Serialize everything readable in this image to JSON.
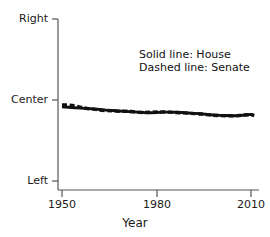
{
  "figure": {
    "background_color": "#ffffff",
    "ink_color": "#111111",
    "axis_color": "#555555"
  },
  "axes": {
    "xlabel": "Year",
    "ylabel": "",
    "x_ticks": [
      "1950",
      "1980",
      "2010"
    ],
    "y_ticks": [
      "Right",
      "Center",
      "Left"
    ]
  },
  "legend": {
    "solid": "Solid line: House",
    "dashed": "Dashed line: Senate"
  },
  "chart_data": {
    "type": "line",
    "title": "",
    "subtitle": "",
    "xlabel": "Year",
    "ylabel": "",
    "xlim": [
      1950,
      2012
    ],
    "ylim": [
      -1,
      1
    ],
    "xticks": [
      1950,
      1980,
      2010
    ],
    "xticklabels": [
      "1950",
      "1980",
      "2010"
    ],
    "yticks": [
      1,
      0,
      -1
    ],
    "yticklabels": [
      "Right",
      "Center",
      "Left"
    ],
    "grid": false,
    "legend_position": "upper-right-inside",
    "annotations": [
      "Solid line: House",
      "Dashed line: Senate"
    ],
    "x": [
      1950,
      1952,
      1954,
      1956,
      1958,
      1960,
      1962,
      1964,
      1966,
      1968,
      1970,
      1972,
      1974,
      1976,
      1978,
      1980,
      1982,
      1984,
      1986,
      1988,
      1990,
      1992,
      1994,
      1996,
      1998,
      2000,
      2002,
      2004,
      2006,
      2008,
      2010,
      2011
    ],
    "series": [
      {
        "name": "House",
        "style": "solid",
        "values": [
          -0.085,
          -0.09,
          -0.095,
          -0.1,
          -0.105,
          -0.11,
          -0.118,
          -0.125,
          -0.13,
          -0.135,
          -0.14,
          -0.145,
          -0.15,
          -0.155,
          -0.158,
          -0.155,
          -0.15,
          -0.15,
          -0.152,
          -0.155,
          -0.16,
          -0.165,
          -0.17,
          -0.178,
          -0.185,
          -0.19,
          -0.192,
          -0.194,
          -0.195,
          -0.185,
          -0.178,
          -0.19
        ]
      },
      {
        "name": "Senate",
        "style": "dashed",
        "values": [
          -0.06,
          -0.062,
          -0.07,
          -0.09,
          -0.105,
          -0.112,
          -0.125,
          -0.13,
          -0.132,
          -0.14,
          -0.138,
          -0.142,
          -0.15,
          -0.155,
          -0.152,
          -0.148,
          -0.148,
          -0.15,
          -0.155,
          -0.158,
          -0.162,
          -0.168,
          -0.172,
          -0.18,
          -0.188,
          -0.192,
          -0.194,
          -0.196,
          -0.192,
          -0.186,
          -0.18,
          -0.192
        ]
      }
    ]
  }
}
